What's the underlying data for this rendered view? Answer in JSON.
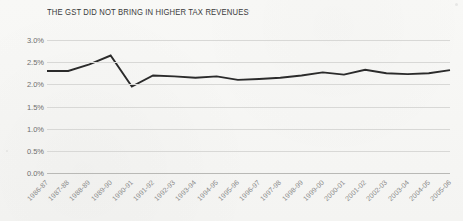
{
  "chart_data": {
    "type": "line",
    "title": "THE GST DID NOT BRING IN HIGHER TAX REVENUES",
    "xlabel": "",
    "ylabel": "",
    "ylim": [
      0,
      3.0
    ],
    "ytick_labels": [
      "3.0%",
      "2.5%",
      "2.0%",
      "1.5%",
      "1.0%",
      "0.5%",
      "0.0%"
    ],
    "ytick_values": [
      3.0,
      2.5,
      2.0,
      1.5,
      1.0,
      0.5,
      0.0
    ],
    "grid": true,
    "legend": "none",
    "line_color": "#2b2b2b",
    "categories": [
      "1986-87",
      "1987-88",
      "1988-89",
      "1989-90",
      "1990-91",
      "1991-92",
      "1992-93",
      "1993-94",
      "1994-95",
      "1995-96",
      "1996-97",
      "1997-98",
      "1998-99",
      "1999-00",
      "2000-01",
      "2001-02",
      "2002-03",
      "2003-04",
      "2004-05",
      "2005-06"
    ],
    "values": [
      2.3,
      2.3,
      2.45,
      2.65,
      1.95,
      2.2,
      2.18,
      2.15,
      2.18,
      2.1,
      2.12,
      2.15,
      2.2,
      2.27,
      2.22,
      2.33,
      2.25,
      2.23,
      2.25,
      2.32
    ],
    "series": [
      {
        "name": "Tax revenue share",
        "values": [
          2.3,
          2.3,
          2.45,
          2.65,
          1.95,
          2.2,
          2.18,
          2.15,
          2.18,
          2.1,
          2.12,
          2.15,
          2.2,
          2.27,
          2.22,
          2.33,
          2.25,
          2.23,
          2.25,
          2.32
        ]
      }
    ]
  }
}
